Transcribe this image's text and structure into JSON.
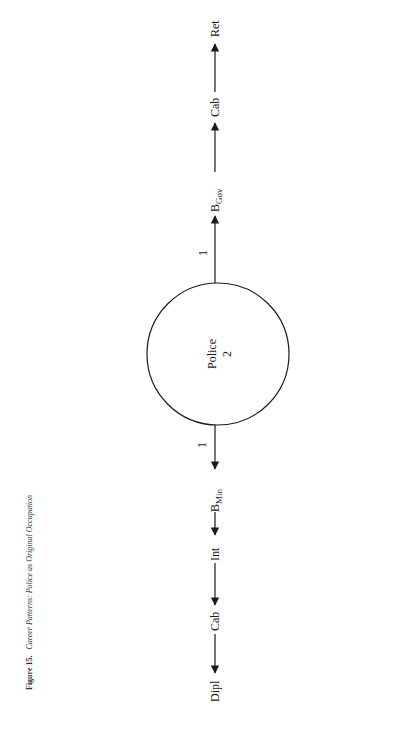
{
  "caption": {
    "figure_label": "Figure 15.",
    "title": "Career Patterns: Police as Original Occupation"
  },
  "center_node": {
    "label": "Police",
    "count": "2"
  },
  "upward_path": {
    "edge_count": "1",
    "nodes": [
      {
        "main": "B",
        "sub": "Gov"
      },
      {
        "main": "Cab",
        "sub": ""
      },
      {
        "main": "Ret",
        "sub": ""
      }
    ]
  },
  "downward_path": {
    "edge_count": "1",
    "nodes": [
      {
        "main": "B",
        "sub": "Min"
      },
      {
        "main": "Int",
        "sub": ""
      },
      {
        "main": "Cab",
        "sub": ""
      },
      {
        "main": "Dipl",
        "sub": ""
      }
    ]
  },
  "colors": {
    "ink": "#1a1a1a",
    "background": "#ffffff"
  }
}
